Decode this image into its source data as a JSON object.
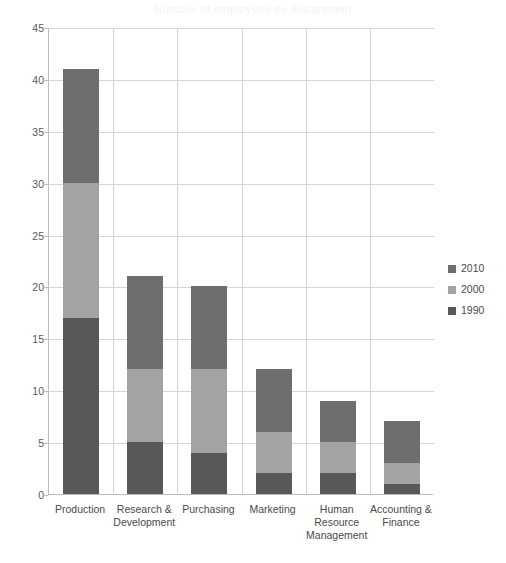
{
  "ghost_title": "Number of employees by department",
  "chart_data": {
    "type": "bar",
    "stacked": true,
    "title": "",
    "xlabel": "",
    "ylabel": "",
    "ylim": [
      0,
      45
    ],
    "ytick_step": 5,
    "yticks": [
      "45",
      "40",
      "35",
      "30",
      "25",
      "20",
      "15",
      "10",
      "5",
      "0"
    ],
    "grid": true,
    "legend_position": "right",
    "categories": [
      "Production",
      "Research &\nDevelopment",
      "Purchasing",
      "Marketing",
      "Human\nResource\nManagement",
      "Accounting &\nFinance"
    ],
    "series": [
      {
        "name": "1990",
        "color": "#585858",
        "values": [
          17,
          5,
          4,
          2,
          2,
          1
        ]
      },
      {
        "name": "2000",
        "color": "#a3a3a3",
        "values": [
          13,
          7,
          8,
          4,
          3,
          2
        ]
      },
      {
        "name": "2010",
        "color": "#6e6e6e",
        "values": [
          11,
          9,
          8,
          6,
          4,
          4
        ]
      }
    ],
    "stack_totals": [
      41,
      21,
      20,
      12,
      9,
      7
    ],
    "legend": [
      {
        "label": "2010",
        "color": "#6e6e6e"
      },
      {
        "label": "2000",
        "color": "#a3a3a3"
      },
      {
        "label": "1990",
        "color": "#585858"
      }
    ],
    "colors": {
      "1990": "#585858",
      "2000": "#a3a3a3",
      "2010": "#6e6e6e",
      "gridline": "#d4d4d4",
      "axis": "#bdbdbd",
      "text": "#4a4a4a",
      "background": "#ffffff"
    }
  }
}
